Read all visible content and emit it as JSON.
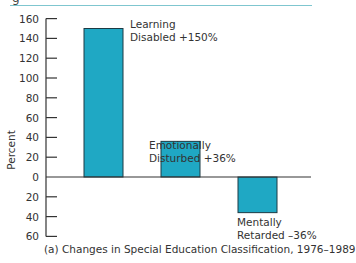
{
  "header": {
    "partial_glyph": "g"
  },
  "chart_data": {
    "type": "bar",
    "title": "",
    "caption": "(a) Changes in Special Education Classification, 1976–1989",
    "xlabel": "",
    "ylabel": "Percent",
    "ylim": [
      -60,
      160
    ],
    "yticks": [
      160,
      140,
      120,
      100,
      80,
      60,
      40,
      20,
      0,
      -20,
      -40,
      -60
    ],
    "ytick_labels": [
      "160",
      "140",
      "120",
      "100",
      "80",
      "60",
      "40",
      "20",
      "0",
      "20",
      "40",
      "60"
    ],
    "grid": false,
    "legend": "none",
    "bar_color": "#1fa8c4",
    "bar_outline": "#1c3a44",
    "categories": [
      "Learning Disabled",
      "Emotionally Disturbed",
      "Mentally Retarded"
    ],
    "values": [
      150,
      36,
      -36
    ],
    "annotations": [
      {
        "line1": "Learning",
        "line2": "Disabled +150%"
      },
      {
        "line1": "Emotionally",
        "line2": "Disturbed +36%"
      },
      {
        "line1": "Mentally",
        "line2": "Retarded –36%"
      }
    ]
  }
}
